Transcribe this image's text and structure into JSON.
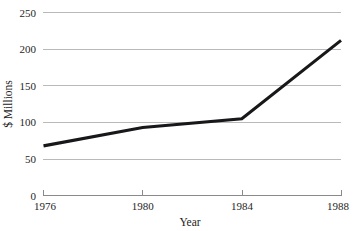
{
  "chart_data": {
    "type": "line",
    "title": "",
    "xlabel": "Year",
    "ylabel": "$ Millions",
    "x": [
      1976,
      1980,
      1984,
      1988
    ],
    "values": [
      68,
      93,
      105,
      212
    ],
    "series": [
      {
        "name": "",
        "values": [
          68,
          93,
          105,
          212
        ]
      }
    ],
    "xlim": [
      1976,
      1988
    ],
    "ylim": [
      0,
      250
    ],
    "x_tick_labels": [
      "1976",
      "1980",
      "1984",
      "1988"
    ],
    "y_tick_labels": [
      "0",
      "50",
      "100",
      "150",
      "200",
      "250"
    ],
    "y_ticks": [
      0,
      50,
      100,
      150,
      200,
      250
    ],
    "grid": true,
    "grid_axis": "y",
    "legend": false,
    "legend_position": "none",
    "colors": {
      "series_line": "#18181a",
      "gridline": "#b9b9b9",
      "axis": "#8a8a8a",
      "text": "#262626",
      "background": "#ffffff"
    }
  },
  "axes": {
    "y_title": "$ Millions",
    "x_title": "Year",
    "y_labels": [
      {
        "value": 250,
        "text": "250"
      },
      {
        "value": 200,
        "text": "200"
      },
      {
        "value": 150,
        "text": "150"
      },
      {
        "value": 100,
        "text": "100"
      },
      {
        "value": 50,
        "text": "50"
      },
      {
        "value": 0,
        "text": "0"
      }
    ],
    "x_labels": [
      {
        "value": 1976,
        "text": "1976"
      },
      {
        "value": 1980,
        "text": "1980"
      },
      {
        "value": 1984,
        "text": "1984"
      },
      {
        "value": 1988,
        "text": "1988"
      }
    ]
  }
}
